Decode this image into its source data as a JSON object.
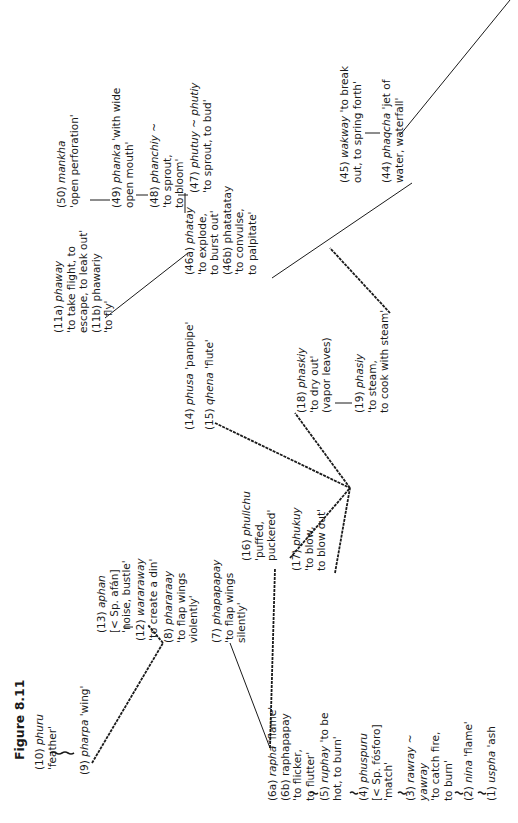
{
  "figure": {
    "title": "Figure 8.11",
    "orientation": "rotated 90° counter-clockwise",
    "entries": [
      {
        "id": "e10",
        "num": "(10)",
        "word": "phuru",
        "lines": [
          "'feather'"
        ]
      },
      {
        "id": "e9",
        "num": "(9)",
        "word": "pharpa",
        "gloss": "'wing'",
        "lines": []
      },
      {
        "id": "e13",
        "num": "(13)",
        "word": "aphan",
        "lines": [
          "[< Sp. afán]",
          "'noise, bustle'"
        ]
      },
      {
        "id": "e12",
        "num": "(12)",
        "word": "wararaway",
        "lines": [
          "'to create a din'"
        ]
      },
      {
        "id": "e8",
        "num": "(8)",
        "word": "phararaay",
        "lines": [
          "'to flap wings",
          "violently'"
        ]
      },
      {
        "id": "e7",
        "num": "(7)",
        "word": "phapapapay",
        "lines": [
          "'to flap wings",
          "silently'"
        ]
      },
      {
        "id": "e6",
        "num": "(6a)",
        "word": "rapha",
        "gloss": "'flame'",
        "lines": [
          "(6b) raphapapay",
          "'to flicker,",
          "to flutter'"
        ]
      },
      {
        "id": "e5",
        "num": "(5)",
        "word": "ruphay",
        "gloss": "'to be",
        "lines": [
          "hot, to burn'"
        ]
      },
      {
        "id": "e4",
        "num": "(4)",
        "word": "phuspuru",
        "lines": [
          "[< Sp. fósforo]",
          "'match'"
        ]
      },
      {
        "id": "e3",
        "num": "(3)",
        "word": "rawray ~",
        "lines": [
          "yawray",
          "'to catch fire,",
          "to burn'"
        ]
      },
      {
        "id": "e2",
        "num": "(2)",
        "word": "nina",
        "gloss": "'flame'",
        "lines": []
      },
      {
        "id": "e1",
        "num": "(1)",
        "word": "uspha",
        "gloss": "'ash",
        "lines": []
      },
      {
        "id": "e14",
        "num": "(14)",
        "word": "phusa",
        "gloss": "'panpipe'",
        "lines": []
      },
      {
        "id": "e15",
        "num": "(15)",
        "word": "qhena",
        "gloss": "'flute'",
        "lines": []
      },
      {
        "id": "e16",
        "num": "(16)",
        "word": "phullchu",
        "lines": [
          "'puffed,",
          "puckered'"
        ]
      },
      {
        "id": "e17",
        "num": "(17)",
        "word": "phukuy",
        "lines": [
          "'to blow,",
          "to blow out'"
        ]
      },
      {
        "id": "e11",
        "num": "(11a)",
        "word": "phaway",
        "lines": [
          "'to take flight, to",
          "escape, to leak out'",
          "(11b) phawariy",
          "'to fly'"
        ]
      },
      {
        "id": "e46",
        "num": "(46a)",
        "word": "phatay",
        "lines": [
          "'to explode,",
          "to burst out'",
          "(46b) phatatatay",
          "'to convulse,",
          "to palpitate'"
        ]
      },
      {
        "id": "e18",
        "num": "(18)",
        "word": "phaskiy",
        "lines": [
          "'to dry out'",
          "(vapor leaves)"
        ]
      },
      {
        "id": "e19",
        "num": "(19)",
        "word": "phasiy",
        "lines": [
          "'to steam,",
          "to cook with steam'"
        ]
      },
      {
        "id": "e50",
        "num": "(50)",
        "word": "mankha",
        "lines": [
          "'open perforation'"
        ]
      },
      {
        "id": "e49",
        "num": "(49)",
        "word": "phanka",
        "gloss": "'with wide",
        "lines": [
          "open mouth'"
        ]
      },
      {
        "id": "e48",
        "num": "(48)",
        "word": "phanchiy ~",
        "lines": [
          "'to sprout,",
          "to bloom'"
        ]
      },
      {
        "id": "e47",
        "num": "(47)",
        "word": "phutuy ~ phutiy",
        "lines": [
          "'to sprout, to bud'"
        ]
      },
      {
        "id": "e45",
        "num": "(45)",
        "word": "wakway",
        "gloss": "'to break",
        "lines": [
          "out, to spring forth'"
        ]
      },
      {
        "id": "e44",
        "num": "(44)",
        "word": "phaqcha",
        "gloss": "'jet of",
        "lines": [
          "water, waterfall'"
        ]
      }
    ]
  }
}
